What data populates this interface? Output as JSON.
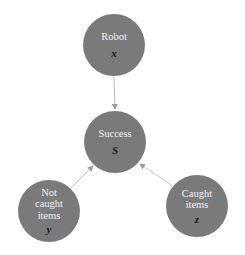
{
  "diagram": {
    "type": "directed-graph",
    "colors": {
      "node_fill": "#7a7a7a",
      "label_text": "#f2f2f2",
      "variable_text": "#1a1a1a",
      "edge": "#b8b8b8",
      "background": "#ffffff"
    },
    "nodes": [
      {
        "id": "robot",
        "label_lines": [
          "Robot"
        ],
        "variable": "x"
      },
      {
        "id": "success",
        "label_lines": [
          "Success"
        ],
        "variable": "S"
      },
      {
        "id": "not_caught",
        "label_lines": [
          "Not",
          "caught",
          "items"
        ],
        "variable": "y"
      },
      {
        "id": "caught",
        "label_lines": [
          "Caught",
          "items"
        ],
        "variable": "z"
      }
    ],
    "edges": [
      {
        "from": "robot",
        "to": "success"
      },
      {
        "from": "not_caught",
        "to": "success"
      },
      {
        "from": "caught",
        "to": "success"
      }
    ]
  }
}
